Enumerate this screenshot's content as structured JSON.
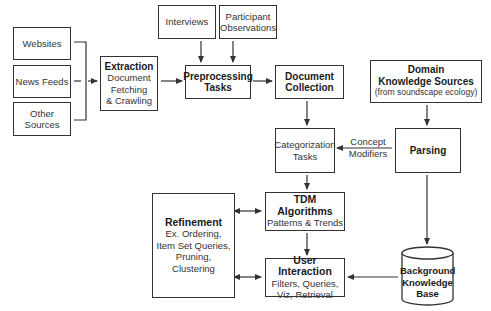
{
  "diagram": {
    "nodes": {
      "websites": {
        "label": "Websites"
      },
      "news_feeds": {
        "label": "News Feeds"
      },
      "other_sources": {
        "line1": "Other",
        "line2": "Sources"
      },
      "extraction": {
        "title": "Extraction",
        "line1": "Document",
        "line2": "Fetching",
        "line3": "& Crawling"
      },
      "interviews": {
        "label": "Interviews"
      },
      "participant_observations": {
        "line1": "Participant",
        "line2": "Observations"
      },
      "preprocessing": {
        "line1": "Preprocessing",
        "line2": "Tasks"
      },
      "document_collection": {
        "line1": "Document",
        "line2": "Collection"
      },
      "domain_knowledge": {
        "line1": "Domain",
        "line2": "Knowledge Sources",
        "line3": "(from soundscape ecology)"
      },
      "parsing": {
        "label": "Parsing"
      },
      "categorization": {
        "line1": "Categorization",
        "line2": "Tasks"
      },
      "tdm_algorithms": {
        "title": "TDM Algorithms",
        "subtitle": "Patterns & Trends"
      },
      "refinement": {
        "title": "Refinement",
        "line1": "Ex. Ordering,",
        "line2": "Item Set Queries,",
        "line3": "Pruning,",
        "line4": "Clustering"
      },
      "user_interaction": {
        "title": "User Interaction",
        "line1": "Filters, Queries,",
        "line2": "Viz, Retrieval"
      },
      "background_kb": {
        "line1": "Background",
        "line2": "Knowledge",
        "line3": "Base"
      }
    },
    "edge_labels": {
      "concept_modifiers": {
        "line1": "Concept",
        "line2": "Modifiers"
      }
    },
    "colors": {
      "stroke": "#333333",
      "background": "#ffffff"
    }
  }
}
